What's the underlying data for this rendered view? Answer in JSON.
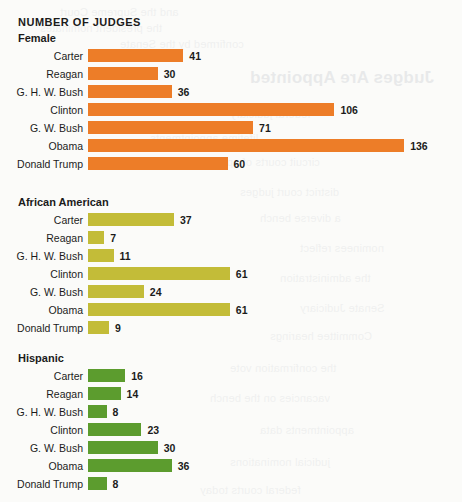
{
  "page": {
    "title": "NUMBER OF JUDGES",
    "background_color": "#fbfbf9",
    "text_color": "#1b1b1b"
  },
  "bleed_text": [
    {
      "text": "Judges Are Appointed",
      "x": 250,
      "y": 68,
      "size": 17,
      "head": true
    },
    {
      "text": "and the Supreme Court",
      "x": 60,
      "y": 6,
      "size": 11,
      "head": false
    },
    {
      "text": "the president nominates",
      "x": 40,
      "y": 22,
      "size": 11,
      "head": false
    },
    {
      "text": "confirmed by the Senate",
      "x": 120,
      "y": 38,
      "size": 11,
      "head": false
    },
    {
      "text": "federal judiciary",
      "x": 230,
      "y": 108,
      "size": 11,
      "head": false
    },
    {
      "text": "lifetime appointments",
      "x": 150,
      "y": 132,
      "size": 11,
      "head": false
    },
    {
      "text": "circuit courts of appeal",
      "x": 205,
      "y": 156,
      "size": 11,
      "head": false
    },
    {
      "text": "district court judges",
      "x": 240,
      "y": 186,
      "size": 11,
      "head": false
    },
    {
      "text": "a diverse bench",
      "x": 260,
      "y": 212,
      "size": 11,
      "head": false
    },
    {
      "text": "nominees reflect",
      "x": 300,
      "y": 242,
      "size": 11,
      "head": false
    },
    {
      "text": "the administration",
      "x": 280,
      "y": 272,
      "size": 11,
      "head": false
    },
    {
      "text": "Senate Judiciary",
      "x": 300,
      "y": 302,
      "size": 11,
      "head": false
    },
    {
      "text": "Committee hearings",
      "x": 270,
      "y": 330,
      "size": 11,
      "head": false
    },
    {
      "text": "the confirmation vote",
      "x": 230,
      "y": 362,
      "size": 11,
      "head": false
    },
    {
      "text": "vacancies on the bench",
      "x": 210,
      "y": 392,
      "size": 11,
      "head": false
    },
    {
      "text": "appointments data",
      "x": 260,
      "y": 424,
      "size": 11,
      "head": false
    },
    {
      "text": "judicial nominations",
      "x": 230,
      "y": 456,
      "size": 11,
      "head": false
    },
    {
      "text": "federal courts today",
      "x": 200,
      "y": 484,
      "size": 11,
      "head": false
    }
  ],
  "chart_data": {
    "type": "bar",
    "orientation": "horizontal",
    "title": "NUMBER OF JUDGES",
    "xlabel": "",
    "ylabel": "",
    "grid": false,
    "legend": "none",
    "value_labels": true,
    "px_per_unit": 2.325,
    "categories": [
      "Carter",
      "Reagan",
      "G. H. W. Bush",
      "Clinton",
      "G. W. Bush",
      "Obama",
      "Donald Trump"
    ],
    "panels": [
      {
        "label": "Female",
        "color": "#ED7D28",
        "values": [
          41,
          30,
          36,
          106,
          71,
          136,
          60
        ]
      },
      {
        "label": "African American",
        "color": "#C3BC38",
        "values": [
          37,
          7,
          11,
          61,
          24,
          61,
          9
        ]
      },
      {
        "label": "Hispanic",
        "color": "#5C9C2E",
        "values": [
          16,
          14,
          8,
          23,
          30,
          36,
          8
        ]
      }
    ],
    "series": [
      {
        "name": "Female",
        "values": [
          41,
          30,
          36,
          106,
          71,
          136,
          60
        ]
      },
      {
        "name": "African American",
        "values": [
          37,
          7,
          11,
          61,
          24,
          61,
          9
        ]
      },
      {
        "name": "Hispanic",
        "values": [
          16,
          14,
          8,
          23,
          30,
          36,
          8
        ]
      }
    ]
  }
}
